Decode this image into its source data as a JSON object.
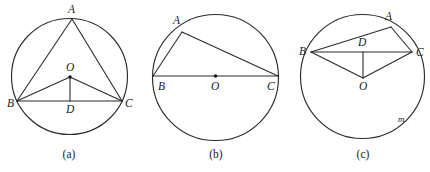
{
  "page": {
    "background_color": "#ffffff",
    "ink_color": "#2b2b2b",
    "width": 430,
    "height": 172
  },
  "figures": [
    {
      "id": "figure-a",
      "caption": "(a)",
      "caption_pos": {
        "x": 69,
        "y": 158
      },
      "circle": {
        "cx": 69.5,
        "cy": 76.5,
        "r": 58
      },
      "description": "Triangle ABC inscribed in circle with center O; D is the foot on chord BC; segments OB, OC, OD drawn",
      "points": [
        {
          "name": "A",
          "label": "A",
          "x": 72,
          "y": 19,
          "label_x": 68,
          "label_y": 13,
          "show_dot": false
        },
        {
          "name": "B",
          "label": "B",
          "x": 17,
          "y": 101,
          "label_x": 7,
          "label_y": 107,
          "show_dot": false
        },
        {
          "name": "C",
          "label": "C",
          "x": 122,
          "y": 101,
          "label_x": 125,
          "label_y": 107,
          "show_dot": false
        },
        {
          "name": "O",
          "label": "O",
          "x": 70,
          "y": 77,
          "label_x": 66,
          "label_y": 71,
          "show_dot": true
        },
        {
          "name": "D",
          "label": "D",
          "x": 70,
          "y": 101,
          "label_x": 66,
          "label_y": 113,
          "show_dot": false
        }
      ],
      "segments": [
        {
          "name": "segment-AB",
          "from": "A",
          "to": "B"
        },
        {
          "name": "segment-AC",
          "from": "A",
          "to": "C"
        },
        {
          "name": "segment-BC",
          "from": "B",
          "to": "C"
        },
        {
          "name": "segment-OB",
          "from": "O",
          "to": "B"
        },
        {
          "name": "segment-OC",
          "from": "O",
          "to": "C"
        },
        {
          "name": "segment-OD",
          "from": "O",
          "to": "D"
        }
      ],
      "arc_labels": []
    },
    {
      "id": "figure-b",
      "caption": "(b)",
      "caption_pos": {
        "x": 216,
        "y": 158
      },
      "circle": {
        "cx": 215.5,
        "cy": 77.5,
        "r": 63
      },
      "description": "Right triangle ABC inscribed in a semicircle; BC is a diameter through center O",
      "points": [
        {
          "name": "A",
          "label": "A",
          "x": 182,
          "y": 32,
          "label_x": 173,
          "label_y": 24,
          "show_dot": false
        },
        {
          "name": "B",
          "label": "B",
          "x": 153,
          "y": 76,
          "label_x": 158,
          "label_y": 90,
          "show_dot": false
        },
        {
          "name": "C",
          "label": "C",
          "x": 278,
          "y": 76,
          "label_x": 267,
          "label_y": 90,
          "show_dot": false
        },
        {
          "name": "O",
          "label": "O",
          "x": 215.5,
          "y": 76,
          "label_x": 211,
          "label_y": 90,
          "show_dot": true
        }
      ],
      "segments": [
        {
          "name": "segment-AB",
          "from": "A",
          "to": "B"
        },
        {
          "name": "segment-AC",
          "from": "A",
          "to": "C"
        },
        {
          "name": "segment-BC-diameter",
          "from": "B",
          "to": "C"
        }
      ],
      "arc_labels": []
    },
    {
      "id": "figure-c",
      "caption": "(c)",
      "caption_pos": {
        "x": 363,
        "y": 158
      },
      "circle": {
        "cx": 362.5,
        "cy": 76.5,
        "r": 62
      },
      "description": "Chord BC with point D on it and A on the major arc; center O below with radii OB, OC, OD; arc marked m",
      "points": [
        {
          "name": "A",
          "label": "A",
          "x": 391,
          "y": 27,
          "label_x": 385,
          "label_y": 20,
          "show_dot": false
        },
        {
          "name": "B",
          "label": "B",
          "x": 311,
          "y": 52,
          "label_x": 299,
          "label_y": 55,
          "show_dot": false
        },
        {
          "name": "C",
          "label": "C",
          "x": 412,
          "y": 52,
          "label_x": 416,
          "label_y": 56,
          "show_dot": false
        },
        {
          "name": "D",
          "label": "D",
          "x": 363,
          "y": 52,
          "label_x": 358,
          "label_y": 46,
          "show_dot": false
        },
        {
          "name": "O",
          "label": "O",
          "x": 363,
          "y": 78,
          "label_x": 359,
          "label_y": 90,
          "show_dot": false
        }
      ],
      "segments": [
        {
          "name": "segment-AB",
          "from": "A",
          "to": "B"
        },
        {
          "name": "segment-AC",
          "from": "A",
          "to": "C"
        },
        {
          "name": "segment-BC",
          "from": "B",
          "to": "C"
        },
        {
          "name": "segment-OB",
          "from": "O",
          "to": "B"
        },
        {
          "name": "segment-OC",
          "from": "O",
          "to": "C"
        },
        {
          "name": "segment-OD",
          "from": "O",
          "to": "D"
        }
      ],
      "arc_labels": [
        {
          "name": "arc-label-m",
          "label": "m",
          "x": 398,
          "y": 122
        }
      ]
    }
  ]
}
